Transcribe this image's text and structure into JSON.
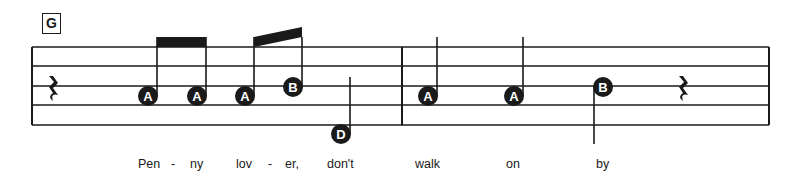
{
  "section_marker": "G",
  "colors": {
    "ink": "#1a1a1a",
    "notehead_text": "#ffffff",
    "background": "#ffffff"
  },
  "measures": [
    {
      "events": [
        {
          "type": "rest",
          "duration": "quarter"
        },
        {
          "type": "note",
          "label": "A",
          "duration": "eighth",
          "stem": "up",
          "beam_group": 1
        },
        {
          "type": "note",
          "label": "A",
          "duration": "eighth",
          "stem": "up",
          "beam_group": 1
        },
        {
          "type": "note",
          "label": "A",
          "duration": "eighth",
          "stem": "up",
          "beam_group": 2
        },
        {
          "type": "note",
          "label": "B",
          "duration": "eighth",
          "stem": "up",
          "beam_group": 2
        },
        {
          "type": "note",
          "label": "D",
          "duration": "quarter",
          "stem": "up"
        }
      ]
    },
    {
      "events": [
        {
          "type": "note",
          "label": "A",
          "duration": "quarter",
          "stem": "up"
        },
        {
          "type": "note",
          "label": "A",
          "duration": "quarter",
          "stem": "up"
        },
        {
          "type": "note",
          "label": "B",
          "duration": "quarter",
          "stem": "down"
        },
        {
          "type": "rest",
          "duration": "quarter"
        }
      ]
    }
  ],
  "lyrics": [
    "Pen",
    "-",
    "ny",
    "lov",
    "-",
    "er,",
    "don't",
    "walk",
    "on",
    "by"
  ]
}
